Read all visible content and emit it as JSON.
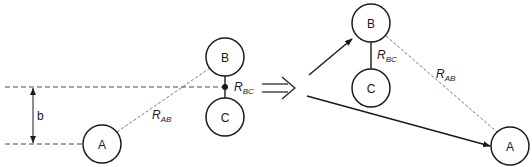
{
  "diagram": {
    "transition_symbol": "⟹",
    "before": {
      "atoms": [
        {
          "id": "A",
          "label": "A"
        },
        {
          "id": "B",
          "label": "B"
        },
        {
          "id": "C",
          "label": "C"
        }
      ],
      "impact_parameter_label": "b",
      "distance_AB": {
        "symbol": "R",
        "subscript": "AB"
      },
      "distance_BC": {
        "symbol": "R",
        "subscript": "BC"
      }
    },
    "after": {
      "atoms": [
        {
          "id": "A",
          "label": "A"
        },
        {
          "id": "B",
          "label": "B"
        },
        {
          "id": "C",
          "label": "C"
        }
      ],
      "distance_AB": {
        "symbol": "R",
        "subscript": "AB"
      },
      "distance_BC": {
        "symbol": "R",
        "subscript": "BC"
      }
    },
    "colors": {
      "stroke": "#1a1a1a",
      "background": "#ffffff"
    }
  }
}
